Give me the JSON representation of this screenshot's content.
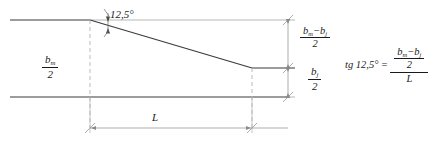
{
  "figure": {
    "kind": "engineering-taper-diagram"
  },
  "labels": {
    "angle": {
      "text": "12,5°",
      "value": 12.5,
      "unit": "degrees",
      "decimal_separator": ","
    },
    "left_dimension": {
      "numerator": "b",
      "numerator_subscript": "m",
      "denominator": "2",
      "full_text": "b_m / 2"
    },
    "right_upper_dimension": {
      "numerator_first": "b",
      "numerator_first_subscript": "m",
      "operator": "−",
      "numerator_second": "b",
      "numerator_second_subscript": "j",
      "denominator": "2",
      "full_text": "(b_m − b_j) / 2"
    },
    "right_lower_dimension": {
      "numerator": "b",
      "numerator_subscript": "j",
      "denominator": "2",
      "full_text": "b_j / 2"
    },
    "length_dimension": {
      "text": "L",
      "full_text": "L"
    }
  },
  "equation": {
    "lhs_function": "tg",
    "lhs_angle": "12,5°",
    "equals": "=",
    "numerator": {
      "term_a": "b",
      "term_a_subscript": "m",
      "operator": "−",
      "term_b": "b",
      "term_b_subscript": "j",
      "over": "2"
    },
    "denominator": "L",
    "full_text": "tg 12,5° = ((b_m − b_j) / 2) / L"
  },
  "geometry": {
    "top_line_y": 20,
    "mid_line_y": 68,
    "bottom_line_y": 97,
    "taper_start_x": 90,
    "taper_end_x": 252,
    "left_edge_x": 10,
    "right_edge_x": 288,
    "dimension_line_x": 288,
    "length_dimension_y": 128
  },
  "colors": {
    "line": "#3a3a3a",
    "thin_line": "#8a8a8a",
    "dashed_line": "#b0b0b0",
    "text": "#1a1a1a",
    "background": "#ffffff"
  }
}
